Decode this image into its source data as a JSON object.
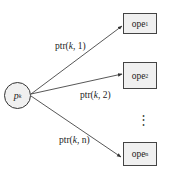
{
  "diagram": {
    "source_node": {
      "label": "p",
      "subscript": "k"
    },
    "targets": [
      {
        "label": "ope",
        "subscript": "1",
        "edge_label": {
          "prefix": "ptr(",
          "var": "k",
          "suffix": ", 1)"
        }
      },
      {
        "label": "ope",
        "subscript": "2",
        "edge_label": {
          "prefix": "ptr(",
          "var": "k",
          "suffix": ", 2)"
        }
      },
      {
        "label": "ope",
        "subscript": "n",
        "edge_label": {
          "prefix": "ptr(",
          "var": "k",
          "suffix": ", n)"
        }
      }
    ],
    "ellipsis": "⋮",
    "colors": {
      "fill": "#f0f0f0",
      "stroke": "#444444",
      "text": "#222222"
    }
  }
}
